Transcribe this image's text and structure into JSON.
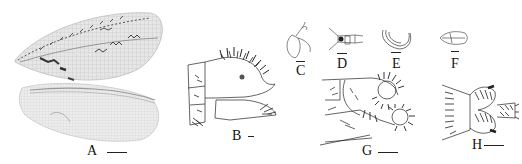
{
  "figure": {
    "panels": [
      {
        "id": "A",
        "label": "A",
        "subject": "forewing-and-hindwing",
        "has_scale_bar": true
      },
      {
        "id": "B",
        "label": "B",
        "subject": "male-terminalia-lateral",
        "has_scale_bar": true
      },
      {
        "id": "C",
        "label": "C",
        "subject": "genital-structure-c",
        "has_scale_bar": true
      },
      {
        "id": "D",
        "label": "D",
        "subject": "genital-structure-d",
        "has_scale_bar": true
      },
      {
        "id": "E",
        "label": "E",
        "subject": "genital-structure-e",
        "has_scale_bar": true
      },
      {
        "id": "F",
        "label": "F",
        "subject": "genital-structure-f",
        "has_scale_bar": true
      },
      {
        "id": "G",
        "label": "G",
        "subject": "female-terminalia-lateral",
        "has_scale_bar": true
      },
      {
        "id": "H",
        "label": "H",
        "subject": "terminalia-ventral",
        "has_scale_bar": true
      }
    ]
  },
  "colors": {
    "background": "#ffffff",
    "ink": "#222222",
    "wing_membrane": "#d8d8d8",
    "wing_marking": "#3a3a3a"
  }
}
